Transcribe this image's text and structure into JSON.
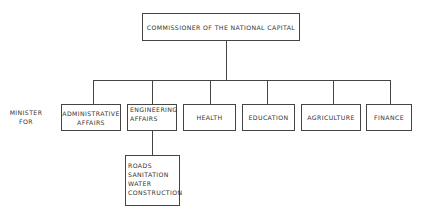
{
  "chart": {
    "root": "COMMISSIONER OF THE NATIONAL CAPITAL",
    "row_label": "MINISTER FOR",
    "ministries": [
      {
        "label_line1": "ADMINISTRATIVE",
        "label_line2": "AFFAIRS"
      },
      {
        "label_line1": "ENGINEERING",
        "label_line2": "AFFAIRS"
      },
      {
        "label_line1": "HEALTH",
        "label_line2": ""
      },
      {
        "label_line1": "EDUCATION",
        "label_line2": ""
      },
      {
        "label_line1": "AGRICULTURE",
        "label_line2": ""
      },
      {
        "label_line1": "FINANCE",
        "label_line2": ""
      }
    ],
    "engineering_sub": [
      "ROADS",
      "SANITATION",
      "WATER",
      "CONSTRUCTION"
    ]
  }
}
